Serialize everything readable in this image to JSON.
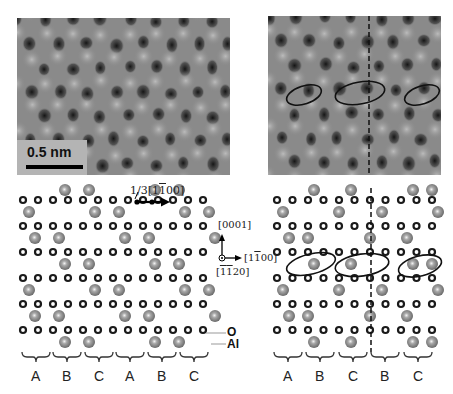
{
  "figure": {
    "left_image": {
      "scale_bar_label": "0.5 nm"
    },
    "right_image": {
      "has_dashed_boundary": true,
      "ellipse_count": 3
    },
    "left_model": {
      "shift_vector_label": "1/3[1̅1̅00]",
      "shift_vector_text": "1/3[1100]",
      "stacking_labels": [
        "A",
        "B",
        "C",
        "A",
        "B",
        "C"
      ],
      "legend": {
        "o_label": "O",
        "al_label": "Al"
      }
    },
    "axes": {
      "vertical": "[0001]",
      "horizontal": "[1̅0]",
      "horizontal_text": "[1100]",
      "out_of_plane": "[1120]"
    },
    "right_model": {
      "stacking_labels": [
        "A",
        "B",
        "C",
        "B",
        "C"
      ]
    },
    "colors": {
      "al_atom": "#8c8c8c",
      "o_atom": "#1a1a1a",
      "ellipse": "#111111"
    }
  }
}
